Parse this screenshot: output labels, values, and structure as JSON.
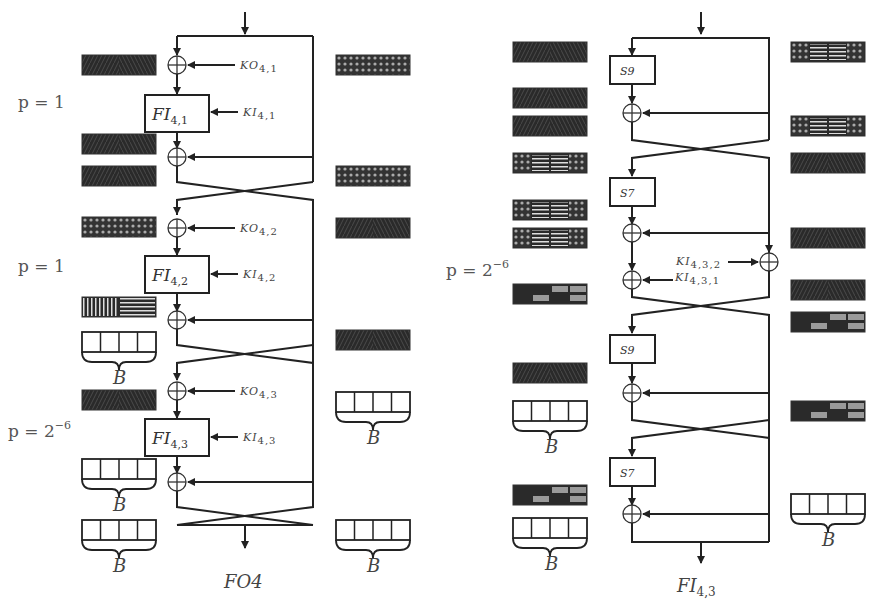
{
  "left_diagram": {
    "caption": "FO4",
    "rounds": [
      {
        "probability": "p = 1",
        "ko_label": "KO",
        "ko_sub": "4,1",
        "fi_label": "FI",
        "fi_sub": "4,1",
        "ki_label": "KI",
        "ki_sub": "4,1"
      },
      {
        "probability": "p = 1",
        "ko_label": "KO",
        "ko_sub": "4,2",
        "fi_label": "FI",
        "fi_sub": "4,2",
        "ki_label": "KI",
        "ki_sub": "4,2"
      },
      {
        "probability_base": "p = 2",
        "probability_exp": "−6",
        "ko_label": "KO",
        "ko_sub": "4,3",
        "fi_label": "FI",
        "fi_sub": "4,3",
        "ki_label": "KI",
        "ki_sub": "4,3"
      }
    ],
    "bucket_label": "B"
  },
  "right_diagram": {
    "caption_base": "FI",
    "caption_sub": "4,3",
    "probability_base": "p = 2",
    "probability_exp": "−6",
    "sboxes": [
      "S9",
      "S7",
      "S9",
      "S7"
    ],
    "ki2_label": "KI",
    "ki2_sub": "4,3,2",
    "ki1_label": "KI",
    "ki1_sub": "4,3,1",
    "bucket_label": "B"
  },
  "legend_patterns": {
    "dense": "diagonal-chevron dark block",
    "crosshatch": "diamond crosshatch block",
    "mixed": "crosshatch + horizontal stripes block",
    "partial": "dark block with gray cells",
    "vstripe": "vertical + horizontal stripes block",
    "bucket": "4-cell bucket with brace"
  },
  "colors": {
    "line": "#222222",
    "block_dark": "#2a2a2a",
    "block_gray": "#9a9a9a"
  }
}
